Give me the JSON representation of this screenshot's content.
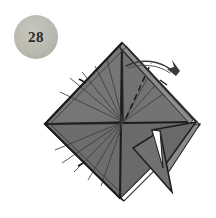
{
  "illustration": {
    "kind": "origami-folding-diagram",
    "title": "Origami step diagram 28",
    "background_color": "#ffffff"
  },
  "step_badge": {
    "number": "28",
    "shape": "circle",
    "fill_color": "#b9b9b0",
    "text_color": "#2b2b2b",
    "center_x": 36,
    "center_y": 37,
    "radius": 22
  },
  "paper": {
    "front_color": "#6f6f6f",
    "front_color_light": "#7b7b7b",
    "back_color": "#8a8a8a",
    "shadow_color": "#5a5a5a",
    "edge_color": "#2b2b2b",
    "white_edge_color": "#ffffff"
  },
  "geometry": {
    "diamond": {
      "top": [
        122,
        43
      ],
      "right": [
        196,
        122
      ],
      "bottom": [
        120,
        198
      ],
      "left": [
        45,
        124
      ],
      "center": [
        123,
        122
      ]
    },
    "flaps": [
      {
        "name": "upper-right-flap",
        "points": "122,43 196,122 163,131 126,92"
      },
      {
        "name": "lower-right-point",
        "points": "196,122 160,170 150,130"
      },
      {
        "name": "lower-middle-point",
        "points": "163,131 171,193 137,149"
      }
    ]
  },
  "crease_lines": {
    "label": "radiating crease lines from center",
    "count_upper_right": 5,
    "count_lower_left": 5,
    "style_solid": "thin dark lines",
    "style_dashed": "valley fold dashed line"
  },
  "arrow": {
    "label": "fold-direction-arrow",
    "description": "curved arrow pointing down-right over the top-right edge",
    "color": "#3a3a3a",
    "start": [
      128,
      66
    ],
    "end": [
      178,
      74
    ]
  },
  "labels": {
    "badge_aria": "Step number badge",
    "figure_aria": "Origami model with radiating creases and a fold arrow"
  }
}
